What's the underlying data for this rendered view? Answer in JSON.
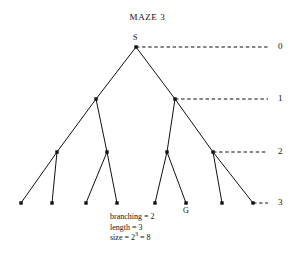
{
  "figure": {
    "title": "MAZE 3",
    "background_color": "#ffffff",
    "ink_color": "#111111",
    "width": 295,
    "height": 264
  },
  "chart_data": {
    "type": "diagram",
    "diagram_kind": "binary-search-tree",
    "title": "MAZE 3",
    "branching_factor": 2,
    "length": 3,
    "size": 8,
    "start_node_label": "S",
    "goal_node_label": "G",
    "depth_labels": [
      "0",
      "1",
      "2",
      "3"
    ],
    "depth_label_positions": [
      {
        "label": "0",
        "x": 278,
        "y": 47
      },
      {
        "label": "1",
        "x": 278,
        "y": 99
      },
      {
        "label": "2",
        "x": 278,
        "y": 152
      },
      {
        "label": "3",
        "x": 278,
        "y": 203
      }
    ],
    "nodes": [
      {
        "id": "s",
        "label": "S",
        "depth": 0,
        "x": 136,
        "y": 47
      },
      {
        "id": "n10",
        "label": "",
        "depth": 1,
        "x": 96,
        "y": 99
      },
      {
        "id": "n11",
        "label": "",
        "depth": 1,
        "x": 175,
        "y": 99
      },
      {
        "id": "n20",
        "label": "",
        "depth": 2,
        "x": 57,
        "y": 152
      },
      {
        "id": "n21",
        "label": "",
        "depth": 2,
        "x": 107,
        "y": 152
      },
      {
        "id": "n22",
        "label": "",
        "depth": 2,
        "x": 167,
        "y": 152
      },
      {
        "id": "n23",
        "label": "",
        "depth": 2,
        "x": 213,
        "y": 152
      },
      {
        "id": "l0",
        "label": "",
        "depth": 3,
        "x": 21,
        "y": 203
      },
      {
        "id": "l1",
        "label": "",
        "depth": 3,
        "x": 52,
        "y": 203
      },
      {
        "id": "l2",
        "label": "",
        "depth": 3,
        "x": 86,
        "y": 203
      },
      {
        "id": "l3",
        "label": "",
        "depth": 3,
        "x": 117,
        "y": 203
      },
      {
        "id": "l4",
        "label": "",
        "depth": 3,
        "x": 155,
        "y": 203
      },
      {
        "id": "l5",
        "label": "G",
        "depth": 3,
        "x": 186,
        "y": 203
      },
      {
        "id": "l6",
        "label": "",
        "depth": 3,
        "x": 222,
        "y": 203
      },
      {
        "id": "l7",
        "label": "",
        "depth": 3,
        "x": 253,
        "y": 203
      }
    ],
    "edges": [
      {
        "from": "s",
        "to": "n10"
      },
      {
        "from": "s",
        "to": "n11"
      },
      {
        "from": "n10",
        "to": "n20"
      },
      {
        "from": "n10",
        "to": "n21"
      },
      {
        "from": "n11",
        "to": "n22"
      },
      {
        "from": "n11",
        "to": "n23"
      },
      {
        "from": "n20",
        "to": "l0"
      },
      {
        "from": "n20",
        "to": "l1"
      },
      {
        "from": "n21",
        "to": "l2"
      },
      {
        "from": "n21",
        "to": "l3"
      },
      {
        "from": "n22",
        "to": "l4"
      },
      {
        "from": "n22",
        "to": "l5"
      },
      {
        "from": "n23",
        "to": "l6"
      },
      {
        "from": "n23",
        "to": "l7"
      }
    ],
    "depth_guides": [
      {
        "label": "0",
        "from_x": 136,
        "to_x": 268,
        "y": 47
      },
      {
        "label": "1",
        "from_x": 175,
        "to_x": 268,
        "y": 99
      },
      {
        "label": "2",
        "from_x": 213,
        "to_x": 268,
        "y": 152
      },
      {
        "label": "3",
        "from_x": 253,
        "to_x": 268,
        "y": 203
      }
    ],
    "node_labels": [
      {
        "text": "S",
        "x": 133,
        "y": 33
      },
      {
        "text": "G",
        "x": 183,
        "y": 206
      }
    ]
  },
  "caption": {
    "branching_line": "branching = 2",
    "length_line": "length = 3",
    "size_prefix": "size = 2",
    "size_exponent": "3",
    "size_suffix": " = 8"
  }
}
